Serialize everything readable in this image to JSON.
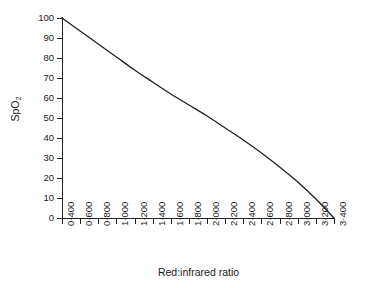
{
  "chart_data": {
    "type": "line",
    "title": "",
    "xlabel": "Red:infrared ratio",
    "ylabel": "SpO2",
    "ylabel_display": "SpO",
    "ylabel_subscript": "2",
    "xlim": [
      0.4,
      3.4
    ],
    "ylim": [
      0,
      100
    ],
    "grid": false,
    "legend": null,
    "x_tick_labels": [
      "0·400",
      "0·600",
      "0·800",
      "1·000",
      "1·200",
      "1·400",
      "1·600",
      "1·800",
      "2·000",
      "2·200",
      "2·400",
      "2·600",
      "2·800",
      "3·000",
      "3·200",
      "3·400"
    ],
    "x_tick_values": [
      0.4,
      0.6,
      0.8,
      1.0,
      1.2,
      1.4,
      1.6,
      1.8,
      2.0,
      2.2,
      2.4,
      2.6,
      2.8,
      3.0,
      3.2,
      3.4
    ],
    "y_tick_labels": [
      "100",
      "90",
      "80",
      "70",
      "60",
      "50",
      "40",
      "30",
      "20",
      "10",
      "0"
    ],
    "y_tick_values": [
      100,
      90,
      80,
      70,
      60,
      50,
      40,
      30,
      20,
      10,
      0
    ],
    "series": [
      {
        "name": "SpO2 calibration curve",
        "color": "#1f1f1f",
        "x": [
          0.4,
          0.6,
          0.8,
          1.0,
          1.2,
          1.4,
          1.6,
          1.8,
          2.0,
          2.2,
          2.4,
          2.6,
          2.8,
          3.0,
          3.2,
          3.4
        ],
        "y": [
          100.0,
          93.5,
          87.0,
          80.5,
          74.0,
          68.0,
          62.0,
          56.5,
          51.0,
          45.0,
          39.0,
          32.5,
          25.5,
          18.0,
          9.5,
          0.0
        ]
      }
    ]
  },
  "axis_color": "#1f1f1f",
  "background": "#ffffff"
}
